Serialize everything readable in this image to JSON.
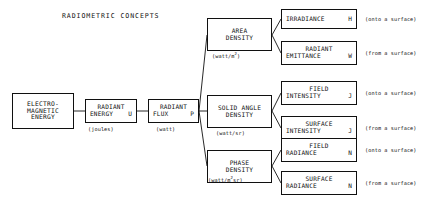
{
  "title": "RADIOMETRIC CONCEPTS",
  "colors": {
    "ink": "#101010",
    "paper": "#ffffff"
  },
  "source_chain": [
    {
      "id": "electromagnetic-energy",
      "lines": [
        "ELECTRO-",
        "MAGNETIC",
        "ENERGY"
      ],
      "symbol": "",
      "units": ""
    },
    {
      "id": "radiant-energy",
      "lines": [
        "RADIANT",
        "ENERGY"
      ],
      "symbol": "U",
      "units": "(joules)"
    },
    {
      "id": "radiant-flux",
      "lines": [
        "RADIANT",
        "FLUX"
      ],
      "symbol": "P",
      "units": "(watt)"
    }
  ],
  "densities": [
    {
      "id": "area-density",
      "lines": [
        "AREA",
        "DENSITY"
      ],
      "units_prefix": "(watt/m",
      "units_sup": "2",
      "units_suffix": ")"
    },
    {
      "id": "solid-angle-density",
      "lines": [
        "SOLID ANGLE",
        "DENSITY"
      ],
      "units_prefix": "(watt/sr)",
      "units_sup": "",
      "units_suffix": ""
    },
    {
      "id": "phase-density",
      "lines": [
        "PHASE",
        "DENSITY"
      ],
      "units_prefix": "(watt/m",
      "units_sup": "2",
      "units_suffix": "sr)"
    }
  ],
  "quantities": [
    {
      "id": "irradiance",
      "lines": [
        "IRRADIANCE"
      ],
      "symbol": "H",
      "annotation": "(onto a surface)"
    },
    {
      "id": "radiant-emittance",
      "lines": [
        "RADIANT",
        "EMITTANCE"
      ],
      "symbol": "W",
      "annotation": "(from a surface)"
    },
    {
      "id": "field-intensity",
      "lines": [
        "FIELD",
        "INTENSITY"
      ],
      "symbol": "J",
      "annotation": "(onto a surface)"
    },
    {
      "id": "surface-intensity",
      "lines": [
        "SURFACE",
        "INTENSITY"
      ],
      "symbol": "J",
      "annotation": "(from a surface)"
    },
    {
      "id": "field-radiance",
      "lines": [
        "FIELD",
        "RADIANCE"
      ],
      "symbol": "N",
      "annotation": "(onto a surface)"
    },
    {
      "id": "surface-radiance",
      "lines": [
        "SURFACE",
        "RADIANCE"
      ],
      "symbol": "N",
      "annotation": "(from a surface)"
    }
  ]
}
